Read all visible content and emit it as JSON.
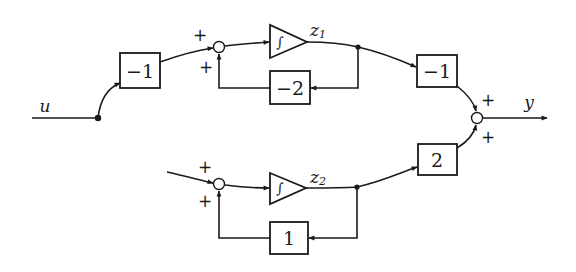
{
  "diagram": {
    "type": "block-diagram",
    "input": {
      "label": "u"
    },
    "output": {
      "label": "y"
    },
    "blocks": {
      "input_gain": {
        "label": "−1"
      },
      "integrator_1": {
        "label": "∫",
        "output_var": "z",
        "output_sub": "1"
      },
      "feedback_1": {
        "label": "−2"
      },
      "output_gain_1": {
        "label": "−1"
      },
      "integrator_2": {
        "label": "∫",
        "output_var": "z",
        "output_sub": "2"
      },
      "feedback_2": {
        "label": "1"
      },
      "output_gain_2": {
        "label": "2"
      }
    },
    "summing_junctions": {
      "sum_1": {
        "signs": [
          "+",
          "+"
        ]
      },
      "sum_2": {
        "signs": [
          "+",
          "+"
        ]
      },
      "sum_out": {
        "signs": [
          "+",
          "+"
        ]
      }
    },
    "edge_color": "#1a1a1a"
  }
}
